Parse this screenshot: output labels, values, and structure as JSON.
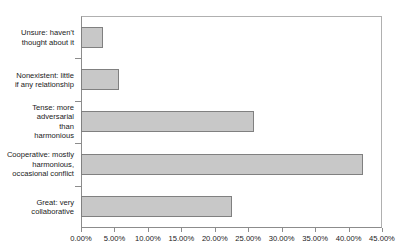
{
  "chart_data": {
    "type": "bar",
    "orientation": "horizontal",
    "title": "",
    "subtitle": "",
    "xlabel": "",
    "ylabel": "",
    "xlim": [
      0,
      45
    ],
    "grid": false,
    "legend": false,
    "categories": [
      "Unsure: haven't thought about it",
      "Nonexistent: little if any relationship",
      "Tense: more adversarial than harmonious",
      "Cooperative: mostly harmonious, occasional conflict",
      "Great: very collaborative"
    ],
    "category_lines": [
      [
        "Unsure: haven't",
        "thought about it"
      ],
      [
        "Nonexistent: little",
        "if any relationship"
      ],
      [
        "Tense: more",
        "adversarial",
        "than",
        "harmonious"
      ],
      [
        "Cooperative: mostly",
        "harmonious,",
        "occasional conflict"
      ],
      [
        "Great: very",
        "collaborative"
      ]
    ],
    "values": [
      3.3,
      5.7,
      25.8,
      42.1,
      22.5
    ],
    "value_unit": "%",
    "xticks": [
      0,
      5,
      10,
      15,
      20,
      25,
      30,
      35,
      40,
      45
    ],
    "xtick_labels": [
      "0.00%",
      "5.00%",
      "10.00%",
      "15.00%",
      "20.00%",
      "25.00%",
      "30.00%",
      "35.00%",
      "40.00%",
      "45.00%"
    ],
    "colors": {
      "bar_fill": "#c8c8c8",
      "bar_border": "#808080",
      "axis": "#8c8c8c",
      "frame": "#b0b0b0",
      "text": "#1a1a1a",
      "background": "#ffffff"
    }
  }
}
